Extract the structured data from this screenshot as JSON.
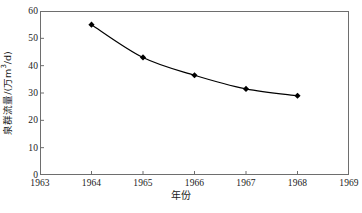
{
  "chart_data": {
    "type": "line",
    "title": "",
    "subtitle": "",
    "xlabel": "年份",
    "ylabel": "泉群流量/(万m³/d)",
    "ylabel_base": "泉群流量/(万m",
    "ylabel_sup": "3",
    "ylabel_tail": "/d)",
    "x": [
      1964,
      1965,
      1966,
      1967,
      1968
    ],
    "values": [
      55,
      43,
      36.5,
      31.5,
      29
    ],
    "series": [
      {
        "name": "泉群流量",
        "x": [
          1964,
          1965,
          1966,
          1967,
          1968
        ],
        "values": [
          55,
          43,
          36.5,
          31.5,
          29
        ],
        "marker": "diamond",
        "marker_color": "#000000",
        "line_color": "#000000"
      }
    ],
    "xlim": [
      1963,
      1969
    ],
    "ylim": [
      0,
      60
    ],
    "xticks": [
      1963,
      1964,
      1965,
      1966,
      1967,
      1968,
      1969
    ],
    "yticks": [
      0,
      10,
      20,
      30,
      40,
      50,
      60
    ],
    "xtick_labels": [
      "1963",
      "1964",
      "1965",
      "1966",
      "1967",
      "1968",
      "1969"
    ],
    "ytick_labels": [
      "0",
      "10",
      "20",
      "30",
      "40",
      "50",
      "60"
    ],
    "grid": false,
    "legend": null,
    "legend_position": "none",
    "frame": true,
    "annotations": []
  },
  "colors": {
    "background": "#ffffff",
    "frame": "#6e6e6e",
    "line": "#000000",
    "marker": "#000000",
    "text": "#1a1a1a"
  }
}
